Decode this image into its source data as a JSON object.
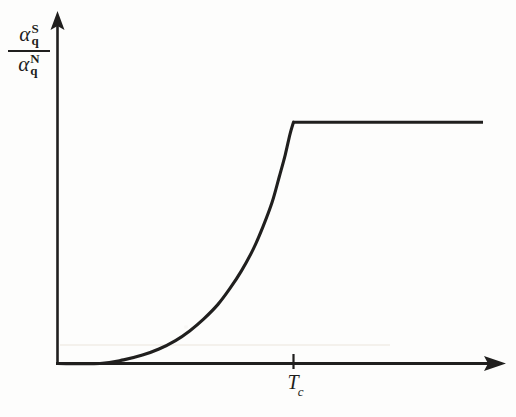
{
  "figure": {
    "background_color": "#fdfdfc",
    "ink_color": "#201f1e"
  },
  "axes": {
    "y_axis": {
      "label_numerator_symbol": "α",
      "label_numerator_sup": "S",
      "label_numerator_sub": "q",
      "label_denominator_symbol": "α",
      "label_denominator_sup": "N",
      "label_denominator_sub": "q",
      "has_arrowhead": true
    },
    "x_axis": {
      "tick_label": "T",
      "tick_label_sub": "c",
      "has_arrowhead": true
    }
  },
  "chart_data": {
    "type": "line",
    "title": "",
    "xlabel": "",
    "ylabel": "α_q^S / α_q^N",
    "grid": false,
    "legend": null,
    "xlim": [
      0,
      1.45
    ],
    "ylim": [
      0,
      1.35
    ],
    "xtick_values": [
      1.0
    ],
    "xtick_labels": [
      "T_c"
    ],
    "ytick_values": [],
    "ytick_labels": [],
    "annotations": [],
    "series": [
      {
        "name": "alpha_q^S / alpha_q^N",
        "comment": "rises from zero tangentially, convex exponential-like growth, sharp corner at T_c then constant plateau at 1",
        "x": [
          0.0,
          0.18,
          0.28,
          0.36,
          0.43,
          0.5,
          0.56,
          0.62,
          0.68,
          0.73,
          0.78,
          0.83,
          0.87,
          0.91,
          0.94,
          0.965,
          0.985,
          1.0,
          1.1,
          1.25,
          1.45
        ],
        "y": [
          0.0,
          0.0,
          0.015,
          0.035,
          0.06,
          0.095,
          0.135,
          0.185,
          0.245,
          0.31,
          0.385,
          0.475,
          0.565,
          0.67,
          0.775,
          0.865,
          0.95,
          1.0,
          1.0,
          1.0,
          1.0
        ]
      }
    ]
  }
}
